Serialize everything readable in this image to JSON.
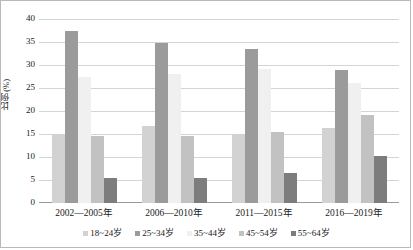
{
  "chart_data": {
    "type": "bar",
    "title": "",
    "xlabel": "",
    "ylabel": "比例(%)",
    "ylim": [
      0,
      40
    ],
    "yticks": [
      0,
      5,
      10,
      15,
      20,
      25,
      30,
      35,
      40
    ],
    "ytick_labels": [
      "0",
      "5",
      "10",
      "15",
      "20",
      "25",
      "30",
      "35",
      "40"
    ],
    "grid": true,
    "legend_position": "bottom",
    "categories": [
      "2002—2005年",
      "2006—2010年",
      "2011—2015年",
      "2016—2019年"
    ],
    "series": [
      {
        "name": "18~24岁",
        "color": "#d2d2d2",
        "values": [
          15.0,
          16.8,
          15.0,
          16.2
        ]
      },
      {
        "name": "25~34岁",
        "color": "#9b9b9b",
        "values": [
          37.5,
          34.7,
          33.4,
          28.9
        ]
      },
      {
        "name": "35~44岁",
        "color": "#f0f0f0",
        "values": [
          27.3,
          28.0,
          29.2,
          26.0
        ]
      },
      {
        "name": "45~54岁",
        "color": "#c2c2c2",
        "values": [
          14.5,
          14.5,
          15.5,
          19.2
        ]
      },
      {
        "name": "55~64岁",
        "color": "#7d7d7d",
        "values": [
          5.4,
          5.4,
          6.6,
          10.2
        ]
      }
    ]
  }
}
